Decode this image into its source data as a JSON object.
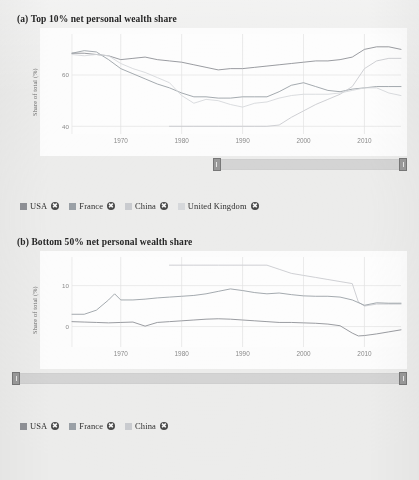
{
  "theme": {
    "page_bg": "#ececeb",
    "card_bg": "#fcfcfc",
    "grid_color": "#e2e2e2",
    "axis_text_color": "#8a8a8a",
    "title_color": "#262626",
    "slider_track": "#d4d4d4",
    "slider_handle": "#9a9a9a"
  },
  "series_colors": {
    "USA": "#8f9196",
    "France": "#9aa0a6",
    "China": "#c9cbcf",
    "United Kingdom": "#d6d8db"
  },
  "panel_a": {
    "title": "(a) Top 10% net personal wealth share",
    "ylabel": "Share of total (%)",
    "yticks": [
      "60",
      "40"
    ],
    "xticks": [
      "1970",
      "1980",
      "1990",
      "2000",
      "2010"
    ],
    "legend": [
      {
        "label": "USA",
        "color": "#8f9196",
        "remove": "✖"
      },
      {
        "label": "France",
        "color": "#9aa0a6",
        "remove": "✖"
      },
      {
        "label": "China",
        "color": "#c9cbcf",
        "remove": "✖"
      },
      {
        "label": "United Kingdom",
        "color": "#d6d8db",
        "remove": "✖"
      }
    ],
    "slider": {
      "start_pct": 45,
      "end_pct": 100
    }
  },
  "panel_b": {
    "title": "(b) Bottom 50% net personal wealth share",
    "ylabel": "Share of total (%)",
    "yticks": [
      "10",
      "0"
    ],
    "xticks": [
      "1970",
      "1980",
      "1990",
      "2000",
      "2010"
    ],
    "legend": [
      {
        "label": "USA",
        "color": "#8f9196",
        "remove": "✖"
      },
      {
        "label": "France",
        "color": "#9aa0a6",
        "remove": "✖"
      },
      {
        "label": "China",
        "color": "#c9cbcf",
        "remove": "✖"
      }
    ],
    "slider": {
      "start_pct": 0,
      "end_pct": 100
    }
  },
  "chart_data": [
    {
      "id": "panel_a",
      "type": "line",
      "title": "(a) Top 10% net personal wealth share",
      "xlabel": "",
      "ylabel": "Share of total (%)",
      "xlim": [
        1962,
        2016
      ],
      "ylim": [
        37,
        76
      ],
      "yticks": [
        40,
        60
      ],
      "xticks": [
        1970,
        1980,
        1990,
        2000,
        2010
      ],
      "grid": true,
      "legend_position": "below",
      "series": [
        {
          "name": "USA",
          "color": "#8f9196",
          "x": [
            1962,
            1964,
            1966,
            1968,
            1970,
            1972,
            1974,
            1976,
            1978,
            1980,
            1982,
            1984,
            1986,
            1988,
            1990,
            1992,
            1994,
            1996,
            1998,
            2000,
            2002,
            2004,
            2006,
            2008,
            2010,
            2012,
            2014,
            2016
          ],
          "values": [
            68.5,
            68.5,
            68.0,
            67.5,
            66.0,
            66.5,
            67.0,
            66.0,
            65.5,
            65.0,
            64.0,
            63.0,
            62.0,
            62.5,
            62.5,
            63.0,
            63.5,
            64.0,
            64.5,
            65.0,
            65.5,
            65.5,
            66.0,
            67.0,
            70.0,
            71.0,
            71.0,
            70.0
          ]
        },
        {
          "name": "France",
          "color": "#9aa0a6",
          "x": [
            1962,
            1964,
            1966,
            1968,
            1970,
            1972,
            1974,
            1976,
            1978,
            1980,
            1982,
            1984,
            1986,
            1988,
            1990,
            1992,
            1994,
            1996,
            1998,
            2000,
            2002,
            2004,
            2006,
            2008,
            2010,
            2012,
            2014,
            2016
          ],
          "values": [
            68.5,
            69.5,
            69.0,
            66.0,
            62.5,
            60.5,
            58.5,
            56.5,
            55.0,
            53.0,
            51.5,
            51.5,
            51.0,
            51.0,
            51.5,
            51.5,
            51.5,
            53.5,
            56.0,
            57.0,
            55.5,
            54.0,
            53.5,
            54.5,
            55.0,
            55.5,
            55.5,
            55.5
          ]
        },
        {
          "name": "China",
          "color": "#c9cbcf",
          "x": [
            1978,
            1982,
            1986,
            1990,
            1992,
            1994,
            1996,
            1998,
            2000,
            2002,
            2004,
            2006,
            2008,
            2010,
            2012,
            2014,
            2016
          ],
          "values": [
            40.0,
            40.0,
            40.0,
            40.0,
            40.0,
            40.0,
            40.5,
            43.5,
            46.0,
            48.5,
            50.5,
            52.5,
            55.5,
            62.5,
            65.5,
            66.5,
            66.5
          ]
        },
        {
          "name": "United Kingdom",
          "color": "#d6d8db",
          "x": [
            1962,
            1964,
            1966,
            1968,
            1970,
            1972,
            1974,
            1976,
            1978,
            1980,
            1982,
            1984,
            1986,
            1988,
            1990,
            1992,
            1994,
            1996,
            1998,
            2000,
            2002,
            2004,
            2006,
            2008,
            2010,
            2012,
            2014,
            2016
          ],
          "values": [
            68.0,
            67.5,
            68.0,
            67.5,
            64.5,
            62.5,
            61.0,
            59.0,
            57.0,
            52.0,
            49.0,
            50.5,
            50.0,
            48.5,
            47.5,
            49.0,
            49.5,
            51.0,
            52.0,
            52.5,
            52.5,
            52.5,
            53.0,
            54.0,
            55.0,
            55.0,
            53.0,
            52.0
          ]
        }
      ]
    },
    {
      "id": "panel_b",
      "type": "line",
      "title": "(b) Bottom 50% net personal wealth share",
      "xlabel": "",
      "ylabel": "Share of total (%)",
      "xlim": [
        1962,
        2016
      ],
      "ylim": [
        -5,
        17
      ],
      "yticks": [
        0,
        10
      ],
      "xticks": [
        1970,
        1980,
        1990,
        2000,
        2010
      ],
      "grid": true,
      "legend_position": "below",
      "series": [
        {
          "name": "China",
          "color": "#c9cbcf",
          "x": [
            1978,
            1982,
            1986,
            1990,
            1994,
            1996,
            1998,
            2000,
            2002,
            2004,
            2006,
            2008,
            2009,
            2010,
            2012,
            2014,
            2016
          ],
          "values": [
            15.0,
            15.0,
            15.0,
            15.0,
            15.0,
            14.0,
            13.0,
            12.5,
            12.0,
            11.5,
            11.0,
            10.5,
            6.0,
            5.0,
            5.5,
            5.5,
            5.5
          ]
        },
        {
          "name": "France",
          "color": "#9aa0a6",
          "x": [
            1962,
            1964,
            1966,
            1968,
            1969,
            1970,
            1972,
            1974,
            1976,
            1978,
            1980,
            1982,
            1984,
            1986,
            1988,
            1990,
            1992,
            1994,
            1996,
            1998,
            2000,
            2002,
            2004,
            2006,
            2008,
            2010,
            2012,
            2014,
            2016
          ],
          "values": [
            3.0,
            3.0,
            4.0,
            6.5,
            8.0,
            6.5,
            6.5,
            6.7,
            7.0,
            7.2,
            7.4,
            7.6,
            8.0,
            8.6,
            9.2,
            8.8,
            8.3,
            8.0,
            8.2,
            7.8,
            7.5,
            7.4,
            7.4,
            7.2,
            6.5,
            5.2,
            5.8,
            5.7,
            5.7
          ]
        },
        {
          "name": "USA",
          "color": "#8f9196",
          "x": [
            1962,
            1964,
            1966,
            1968,
            1970,
            1972,
            1974,
            1976,
            1978,
            1980,
            1982,
            1984,
            1986,
            1988,
            1990,
            1992,
            1994,
            1996,
            1998,
            2000,
            2002,
            2004,
            2006,
            2008,
            2009,
            2010,
            2012,
            2014,
            2016
          ],
          "values": [
            1.2,
            1.1,
            1.0,
            0.9,
            1.0,
            1.1,
            0.1,
            1.0,
            1.2,
            1.4,
            1.6,
            1.8,
            1.9,
            1.8,
            1.6,
            1.4,
            1.2,
            1.0,
            1.0,
            0.9,
            0.8,
            0.6,
            0.2,
            -1.6,
            -2.3,
            -2.2,
            -1.8,
            -1.3,
            -0.8
          ]
        }
      ]
    }
  ]
}
